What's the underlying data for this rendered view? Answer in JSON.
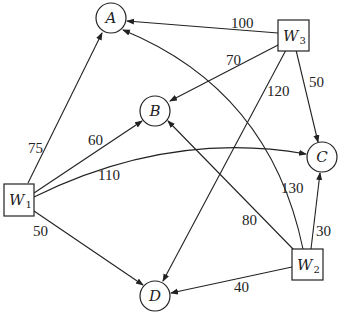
{
  "diagram": {
    "type": "directed-weighted-graph",
    "nodes": [
      {
        "id": "A",
        "label": "A",
        "shape": "circle"
      },
      {
        "id": "B",
        "label": "B",
        "shape": "circle"
      },
      {
        "id": "C",
        "label": "C",
        "shape": "circle"
      },
      {
        "id": "D",
        "label": "D",
        "shape": "circle"
      },
      {
        "id": "W1",
        "label": "W",
        "sub": "1",
        "shape": "square"
      },
      {
        "id": "W2",
        "label": "W",
        "sub": "2",
        "shape": "square"
      },
      {
        "id": "W3",
        "label": "W",
        "sub": "3",
        "shape": "square"
      }
    ],
    "edges": [
      {
        "from": "W1",
        "to": "A",
        "weight": "75"
      },
      {
        "from": "W1",
        "to": "B",
        "weight": "60"
      },
      {
        "from": "W1",
        "to": "C",
        "weight": "110"
      },
      {
        "from": "W1",
        "to": "D",
        "weight": "50"
      },
      {
        "from": "W3",
        "to": "A",
        "weight": "100"
      },
      {
        "from": "W3",
        "to": "B",
        "weight": "70"
      },
      {
        "from": "W3",
        "to": "D",
        "weight": "120"
      },
      {
        "from": "W3",
        "to": "C",
        "weight": "50"
      },
      {
        "from": "W2",
        "to": "A",
        "weight": "130"
      },
      {
        "from": "W2",
        "to": "B",
        "weight": "80"
      },
      {
        "from": "W2",
        "to": "C",
        "weight": "30"
      },
      {
        "from": "W2",
        "to": "D",
        "weight": "40"
      }
    ]
  }
}
